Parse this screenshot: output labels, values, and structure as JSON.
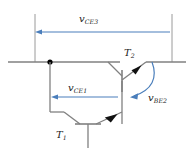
{
  "figure": {
    "kind": "circuit-schematic",
    "width": 192,
    "height": 160,
    "background": "#ffffff"
  },
  "colors": {
    "wire": "#808080",
    "arrow": "#4a7ebb",
    "text": "#1a1a1a",
    "node": "#000000",
    "tick": "#909090"
  },
  "labels": {
    "vce3": {
      "symbol": "v",
      "sub": "CE3",
      "text": "vCE3"
    },
    "vce1": {
      "symbol": "v",
      "sub": "CE1",
      "text": "vCE1"
    },
    "vbe2": {
      "symbol": "v",
      "sub": "BE2",
      "text": "vBE2"
    },
    "t2": {
      "symbol": "T",
      "sub": "2",
      "text": "T2"
    },
    "t1": {
      "symbol": "T",
      "sub": "1",
      "text": "T1"
    }
  },
  "annotations": [
    {
      "name": "vce3-arrow",
      "direction": "left",
      "style": "straight",
      "label": "vCE3"
    },
    {
      "name": "vce1-arrow",
      "direction": "left",
      "style": "straight",
      "label": "vCE1"
    },
    {
      "name": "vbe2-arrow",
      "direction": "down-left",
      "style": "curved",
      "label": "vBE2"
    }
  ],
  "components": [
    {
      "name": "transistor-t2",
      "type": "npn-bjt",
      "label": "T2"
    },
    {
      "name": "transistor-t1",
      "type": "npn-bjt",
      "label": "T1"
    },
    {
      "name": "junction-node",
      "type": "node"
    }
  ]
}
